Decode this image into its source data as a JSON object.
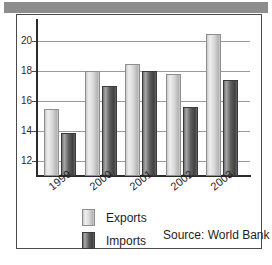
{
  "figure": {
    "frame_color": "#4a4a4a",
    "band_color": "#8d8d8d",
    "background": "#ffffff"
  },
  "legend": {
    "position": "below-axis-left",
    "entries": [
      {
        "label": "Exports",
        "color": "#d9d9d9",
        "swatch": "exports-swatch"
      },
      {
        "label": "Imports",
        "color": "#5e5e5e",
        "swatch": "imports-swatch"
      }
    ]
  },
  "source_note": "Source: World Bank",
  "chart_data": {
    "type": "bar",
    "title": "",
    "subtitle": "",
    "xlabel": "",
    "ylabel": "",
    "categories": [
      "1999",
      "2000",
      "2001",
      "2002",
      "2003"
    ],
    "series": [
      {
        "name": "Exports",
        "color": "#d9d9d9",
        "values": [
          15.5,
          18.0,
          18.5,
          17.8,
          20.5
        ]
      },
      {
        "name": "Imports",
        "color": "#5e5e5e",
        "values": [
          13.9,
          17.0,
          18.0,
          15.6,
          17.4
        ]
      }
    ],
    "ylim": [
      11,
      21.4
    ],
    "yticks": [
      12,
      14,
      16,
      18,
      20
    ],
    "ytick_labels": [
      "12",
      "14",
      "16",
      "18",
      "20"
    ],
    "grid": true,
    "grid_axis": "y",
    "legend_position": "bottom-left",
    "annotations": [
      "Source: World Bank"
    ]
  }
}
